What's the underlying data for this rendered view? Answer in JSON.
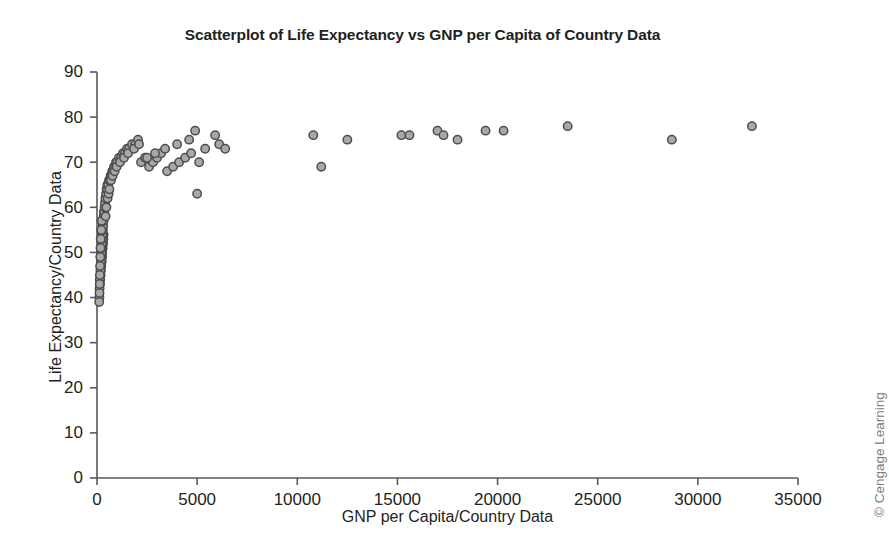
{
  "figure": {
    "background_color": "#ffffff",
    "watermark": "© Cengage Learning"
  },
  "chart_data": {
    "type": "scatter",
    "title": "Scatterplot of Life Expectancy vs GNP per Capita of Country Data",
    "xlabel": "GNP per Capita/Country Data",
    "ylabel": "Life Expectancy/Country Data",
    "xlim": [
      0,
      35000
    ],
    "ylim": [
      0,
      90
    ],
    "xticks": [
      0,
      5000,
      10000,
      15000,
      20000,
      25000,
      30000,
      35000
    ],
    "yticks": [
      0,
      10,
      20,
      30,
      40,
      50,
      60,
      70,
      80,
      90
    ],
    "xtick_labels": [
      "0",
      "5000",
      "10000",
      "15000",
      "20000",
      "25000",
      "30000",
      "35000"
    ],
    "ytick_labels": [
      "0",
      "10",
      "20",
      "30",
      "40",
      "50",
      "60",
      "70",
      "80",
      "90"
    ],
    "grid": false,
    "legend": false,
    "marker": {
      "shape": "circle",
      "fill_color": "#a6a8ab",
      "edge_color": "#4d4d4f",
      "size_px": 4.2
    },
    "series": [
      {
        "name": "Countries",
        "x": [
          120,
          150,
          160,
          180,
          190,
          200,
          210,
          220,
          230,
          240,
          250,
          250,
          260,
          270,
          280,
          290,
          300,
          310,
          320,
          330,
          130,
          140,
          170,
          195,
          205,
          215,
          225,
          235,
          245,
          255,
          265,
          275,
          285,
          295,
          305,
          315,
          325,
          335,
          345,
          355,
          110,
          125,
          135,
          145,
          155,
          165,
          175,
          185,
          215,
          235,
          360,
          380,
          400,
          420,
          450,
          480,
          500,
          520,
          560,
          600,
          640,
          680,
          720,
          760,
          800,
          850,
          900,
          950,
          1000,
          1100,
          1200,
          1300,
          1400,
          1500,
          1600,
          1750,
          1900,
          2050,
          2200,
          2400,
          2600,
          2800,
          3000,
          3200,
          3500,
          3800,
          4100,
          4400,
          4700,
          4900,
          5000,
          5100,
          5400,
          5900,
          6100,
          6400,
          10800,
          11200,
          12500,
          15200,
          15600,
          17000,
          17300,
          18000,
          19400,
          20300,
          23500,
          28700,
          32700,
          430,
          470,
          530,
          580,
          620,
          700,
          780,
          880,
          980,
          1150,
          1350,
          1550,
          1850,
          2100,
          2500,
          2900,
          3400,
          4000,
          4600
        ],
        "y": [
          40,
          43,
          44,
          45,
          46,
          47,
          47,
          48,
          48,
          49,
          49,
          50,
          50,
          51,
          51,
          52,
          52,
          53,
          53,
          54,
          42,
          44,
          46,
          48,
          49,
          50,
          51,
          52,
          53,
          54,
          54,
          55,
          55,
          56,
          56,
          57,
          57,
          58,
          58,
          59,
          39,
          41,
          43,
          45,
          47,
          49,
          51,
          53,
          55,
          57,
          59,
          60,
          61,
          62,
          63,
          64,
          64,
          65,
          65,
          66,
          66,
          67,
          67,
          68,
          68,
          69,
          69,
          70,
          70,
          71,
          71,
          72,
          72,
          73,
          73,
          74,
          74,
          75,
          70,
          71,
          69,
          70,
          71,
          72,
          68,
          69,
          70,
          71,
          72,
          77,
          63,
          70,
          73,
          76,
          74,
          73,
          76,
          69,
          75,
          76,
          76,
          77,
          76,
          75,
          77,
          77,
          78,
          75,
          78,
          58,
          60,
          62,
          63,
          64,
          66,
          67,
          68,
          69,
          70,
          71,
          72,
          73,
          74,
          71,
          72,
          73,
          74,
          75
        ]
      }
    ]
  }
}
